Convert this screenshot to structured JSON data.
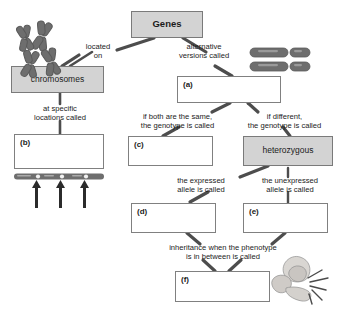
{
  "diagram": {
    "type": "concept-map",
    "colors": {
      "filled_box_fill": "#d3d3d3",
      "box_border": "#808080",
      "connector": "#4d4d4d",
      "text": "#1b1b1b",
      "chromosome_art": "#6e6e6e",
      "page_background": "#ffffff"
    }
  },
  "nodes": [
    {
      "id": "genes",
      "label": "Genes",
      "style": "filled",
      "blank": false
    },
    {
      "id": "chromosomes",
      "label": "chromosomes",
      "style": "filled",
      "blank": false
    },
    {
      "id": "a",
      "label": "(a)",
      "style": "blank",
      "blank": true
    },
    {
      "id": "b",
      "label": "(b)",
      "style": "blank",
      "blank": true
    },
    {
      "id": "c",
      "label": "(c)",
      "style": "blank",
      "blank": true
    },
    {
      "id": "heterozygous",
      "label": "heterozygous",
      "style": "filled",
      "blank": false
    },
    {
      "id": "d",
      "label": "(d)",
      "style": "blank",
      "blank": true
    },
    {
      "id": "e",
      "label": "(e)",
      "style": "blank",
      "blank": true
    },
    {
      "id": "f",
      "label": "(f)",
      "style": "blank",
      "blank": true
    }
  ],
  "connectors": [
    {
      "id": "located-on",
      "text": "located\non",
      "from": "genes",
      "to": "chromosomes"
    },
    {
      "id": "alternative-versions",
      "text": "alternative\nversions called",
      "from": "genes",
      "to": "a"
    },
    {
      "id": "at-specific-locations",
      "text": "at specific\nlocations called",
      "from": "chromosomes",
      "to": "b"
    },
    {
      "id": "if-both-same",
      "text": "if both are the same,\nthe genotype is called",
      "from": "a",
      "to": "c"
    },
    {
      "id": "if-different",
      "text": "if different,\nthe genotype is called",
      "from": "a",
      "to": "heterozygous"
    },
    {
      "id": "expressed-allele",
      "text": "the expressed\nallele is called",
      "from": "heterozygous",
      "to": "d"
    },
    {
      "id": "unexpressed-allele",
      "text": "the unexpressed\nallele is called",
      "from": "heterozygous",
      "to": "e"
    },
    {
      "id": "incomplete-dominance",
      "text": "inheritance when the phenotype\nis in between is called",
      "from": "d",
      "to": "f"
    }
  ],
  "artwork": [
    {
      "id": "chromosomes-cluster",
      "name": "chromosome-cluster-illustration"
    },
    {
      "id": "homologous-pair",
      "name": "homologous-chromosome-pair-illustration"
    },
    {
      "id": "locus-bar",
      "name": "chromosome-locus-bar-illustration"
    },
    {
      "id": "locus-arrows",
      "name": "locus-pointer-arrows-illustration"
    },
    {
      "id": "flower",
      "name": "pink-flower-illustration"
    }
  ]
}
